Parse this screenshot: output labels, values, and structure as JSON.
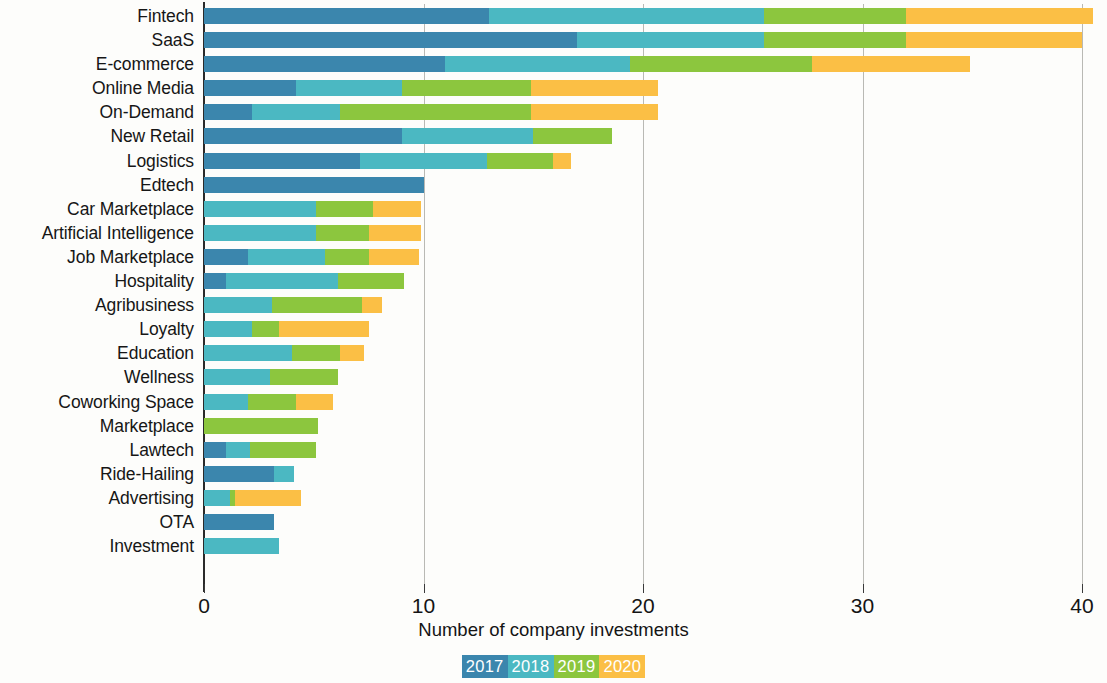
{
  "chart_data": {
    "type": "bar",
    "orientation": "horizontal",
    "stacked": true,
    "title": "",
    "xlabel": "Number of company investments",
    "ylabel": "",
    "xlim": [
      0,
      41
    ],
    "xticks": [
      0,
      10,
      20,
      30,
      40
    ],
    "xtick_labels": [
      "0",
      "10",
      "20",
      "30",
      "40"
    ],
    "grid": "vertical",
    "legend_position": "bottom",
    "series": [
      {
        "name": "2017",
        "color": "#3b86ad",
        "values": [
          13,
          17,
          11,
          4.2,
          2.2,
          9,
          7.1,
          10,
          0,
          0,
          2,
          1,
          0,
          0,
          0,
          0,
          0,
          0,
          1,
          3.2,
          0,
          3.2,
          0
        ]
      },
      {
        "name": "2018",
        "color": "#4bb8c2",
        "values": [
          12.5,
          8.5,
          8.4,
          4.8,
          4,
          6,
          5.8,
          0,
          5.1,
          5.1,
          3.5,
          5.1,
          3.1,
          2.2,
          4,
          3,
          2,
          0,
          1.1,
          0.9,
          1.2,
          0,
          3.4
        ]
      },
      {
        "name": "2019",
        "color": "#8cc63e",
        "values": [
          6.5,
          6.5,
          8.3,
          5.9,
          8.7,
          3.6,
          3,
          0,
          2.6,
          2.4,
          2,
          3,
          4.1,
          1.2,
          2.2,
          3.1,
          2.2,
          5.2,
          3,
          0,
          0.2,
          0,
          0
        ]
      },
      {
        "name": "2020",
        "color": "#fbbf45",
        "values": [
          8.5,
          8,
          7.2,
          5.8,
          5.8,
          0,
          0.8,
          0,
          2.2,
          2.4,
          2.3,
          0,
          0.9,
          4.1,
          1.1,
          0,
          1.7,
          0,
          0,
          0,
          3,
          0,
          0
        ]
      }
    ],
    "categories": [
      "Fintech",
      "SaaS",
      "E-commerce",
      "Online Media",
      "On-Demand",
      "New Retail",
      "Logistics",
      "Edtech",
      "Car Marketplace",
      "Artificial Intelligence",
      "Job Marketplace",
      "Hospitality",
      "Agribusiness",
      "Loyalty",
      "Education",
      "Wellness",
      "Coworking Space",
      "Marketplace",
      "Lawtech",
      "Ride-Hailing",
      "Advertising",
      "OTA",
      "Investment"
    ],
    "totals": [
      40.5,
      40,
      34.9,
      20.7,
      20.7,
      18.6,
      16.7,
      10,
      9.9,
      9.9,
      9.8,
      9.1,
      8.1,
      7.5,
      7.3,
      6.1,
      5.9,
      5.2,
      5.1,
      4.1,
      4.4,
      3.2,
      3.4
    ]
  },
  "legend": {
    "items": [
      {
        "label": "2017",
        "color": "#3b86ad"
      },
      {
        "label": "2018",
        "color": "#4bb8c2"
      },
      {
        "label": "2019",
        "color": "#8cc63e"
      },
      {
        "label": "2020",
        "color": "#fbbf45"
      }
    ]
  }
}
